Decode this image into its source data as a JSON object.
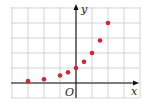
{
  "chart_data": {
    "type": "scatter",
    "title": "",
    "xlabel": "x",
    "ylabel": "y",
    "origin_label": "O",
    "xlim": [
      -4.0,
      3.0
    ],
    "ylim": [
      -0.7,
      5.2
    ],
    "grid": true,
    "legend": "none",
    "series": [
      {
        "name": "points",
        "color": "#d0263a",
        "x": [
          -3,
          -2,
          -1,
          -0.5,
          0,
          0.5,
          1,
          1.5,
          2
        ],
        "y": [
          0.125,
          0.25,
          0.5,
          0.71,
          1,
          1.41,
          2,
          2.83,
          4
        ]
      }
    ]
  },
  "colors": {
    "grid": "#c9c9c9",
    "axis": "#111111",
    "point": "#d0263a",
    "frame": "#bdbdbd"
  }
}
